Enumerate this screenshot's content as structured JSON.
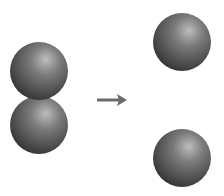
{
  "diagram": {
    "background": "#ffffff",
    "sphere_color_light": "#bdbdbd",
    "sphere_color_mid": "#6e6e6e",
    "sphere_color_dark": "#2e2e2e",
    "arrow_color": "#6a6a6a",
    "molecule": {
      "label": "",
      "atoms": [
        {
          "cx": 39,
          "cy": 71,
          "r": 29
        },
        {
          "cx": 39,
          "cy": 125,
          "r": 29
        }
      ]
    },
    "arrow": {
      "x1": 97,
      "y1": 100,
      "x2": 127,
      "y2": 100
    },
    "products": {
      "label": "",
      "atoms": [
        {
          "cx": 182,
          "cy": 42,
          "r": 29
        },
        {
          "cx": 182,
          "cy": 158,
          "r": 29
        }
      ]
    }
  }
}
